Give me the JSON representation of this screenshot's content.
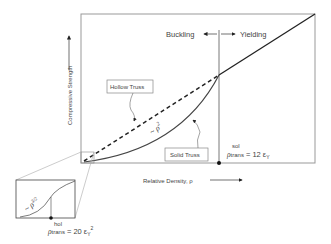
{
  "diagram": {
    "type": "strength-vs-density schematic",
    "axes": {
      "y_label": "Compressive Strength",
      "x_label": "Relative Density, ρ"
    },
    "regimes": {
      "left": "Buckling",
      "right": "Yielding"
    },
    "curves": [
      {
        "name": "Hollow Truss",
        "style": "dashed",
        "scaling_left": "~ ρ^(3/2)"
      },
      {
        "name": "Solid Truss",
        "style": "solid",
        "scaling_left": "~ ρ²"
      }
    ],
    "labels": {
      "hollow_truss": "Hollow Truss",
      "solid_truss": "Solid Truss",
      "solid_scaling": "~ ρ",
      "solid_scaling_exp": "2",
      "hollow_scaling": "~ ρ",
      "hollow_scaling_exp": "3/2"
    },
    "transitions": {
      "solid": {
        "symbol": "ρ",
        "sup": "sol",
        "sub": "trans",
        "expr": "= 12 ε",
        "expr_sub": "Y"
      },
      "hollow": {
        "symbol": "ρ",
        "sup": "hol",
        "sub": "trans",
        "expr": "= 20 ε",
        "expr_sub": "Y",
        "expr_sup": "2"
      }
    },
    "colors": {
      "line": "#222222",
      "frame": "#888888",
      "text": "#444444"
    }
  }
}
